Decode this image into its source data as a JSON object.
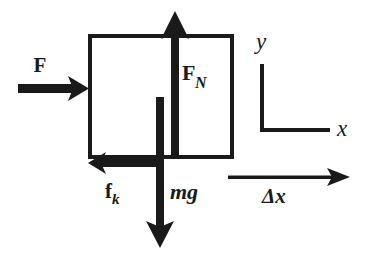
{
  "diagram": {
    "background_color": "#ffffff",
    "stroke_color": "#1a1a1a",
    "block": {
      "name": "block",
      "x": 88,
      "y": 34,
      "width": 144,
      "height": 123,
      "stroke_width": 4,
      "fill": "none"
    },
    "vectors": [
      {
        "id": "applied-force",
        "label": "F",
        "label_style": "bold",
        "subscript": "",
        "direction": "right",
        "description": "applied force arrow pointing right into the left face of the block",
        "shaft_thickness": 8,
        "tail_x": 18,
        "tip_x": 89,
        "y": 88,
        "label_x": 40,
        "label_y": 72,
        "font_size": 21
      },
      {
        "id": "normal-force",
        "label": "F",
        "label_style": "bold",
        "subscript": "N",
        "subscript_style": "bold-italic",
        "direction": "up",
        "description": "normal force arrow pointing up from bottom edge of block through the top",
        "shaft_thickness": 7,
        "tail_y": 158,
        "tip_y": 11,
        "x": 175,
        "label_x": 182,
        "label_y": 82,
        "font_size": 21
      },
      {
        "id": "weight",
        "label": "mg",
        "label_style": "italic-m-bold-g",
        "direction": "down",
        "description": "weight arrow mg pointing down from inside the block past the bottom edge",
        "shaft_thickness": 7,
        "tail_y": 97,
        "tip_y": 248,
        "x": 160,
        "label_x": 170,
        "label_y": 199,
        "font_size": 21
      },
      {
        "id": "kinetic-friction",
        "label": "f",
        "label_style": "bold",
        "subscript": "k",
        "subscript_style": "bold-italic",
        "direction": "left",
        "description": "kinetic friction arrow pointing left along the bottom edge of the block",
        "shaft_thickness": 7,
        "tail_x": 161,
        "tip_x": 88,
        "y": 163,
        "label_x": 104,
        "label_y": 199,
        "font_size": 20
      }
    ],
    "axes": {
      "name": "coordinate-axes",
      "description": "L-shaped coordinate axes showing positive x to the right and positive y upward",
      "corner_x": 262,
      "corner_y": 130,
      "vertical_top_y": 64,
      "horizontal_right_x": 330,
      "stroke_width": 4,
      "x_label": "x",
      "x_label_style": "italic",
      "x_label_x": 337,
      "x_label_y": 136,
      "y_label": "y",
      "y_label_style": "italic",
      "y_label_x": 256,
      "y_label_y": 49,
      "font_size": 21
    },
    "displacement": {
      "name": "displacement-vector",
      "label": "Δx",
      "label_style": "bold-delta-bold-italic-x",
      "description": "thin displacement arrow pointing right labelled delta x",
      "tail_x": 228,
      "tip_x": 350,
      "y": 177,
      "shaft_thickness": 3,
      "label_x": 262,
      "label_y": 202,
      "font_size": 20
    }
  }
}
